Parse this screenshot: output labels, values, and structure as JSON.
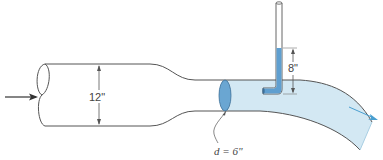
{
  "diagram": {
    "type": "venturi-pitot-pipe-flow",
    "labels": {
      "large_diameter": "12\"",
      "throat_diameter": "d = 6\"",
      "pitot_height": "8\""
    },
    "colors": {
      "pipe_outline": "#555555",
      "water_fill": "#cfe6f1",
      "water_dark": "#5a9ccc",
      "water_column": "#6aa8d4",
      "flow_arrow": "#4a9fd0",
      "text": "#444444"
    }
  }
}
